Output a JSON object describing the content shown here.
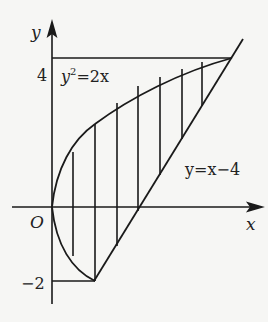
{
  "figure": {
    "axes": {
      "x_label": "x",
      "y_label": "y",
      "origin_label": "O",
      "y_ticks": [
        {
          "label": "4",
          "value": 4
        },
        {
          "label": "−2",
          "value": -2
        }
      ]
    },
    "curves": [
      {
        "label_base": "y",
        "label_sup": "2",
        "label_rest": "=2x",
        "equation": "y^2=2x"
      },
      {
        "label": "y=x−4",
        "equation": "y=x-4"
      }
    ],
    "intersection_points": [
      [
        2,
        -2
      ],
      [
        8,
        4
      ]
    ],
    "shaded_region": "vertical hatching between parabola and line",
    "colors": {
      "ink": "#1a1a1a",
      "paper": "#f6f6f4"
    }
  }
}
